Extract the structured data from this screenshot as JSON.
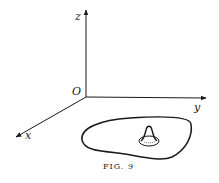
{
  "figure": {
    "caption": "Fig. 9",
    "caption_display": "FIG. 9",
    "axes": {
      "origin_label": "O",
      "z_label": "z",
      "y_label": "y",
      "x_label": "x"
    },
    "elements": [
      "three coordinate axes (x, y, z) from origin O",
      "closed curve region in the xy-plane",
      "small bump/peak surface inside the region"
    ],
    "colors": {
      "ink": "#1a1a1a",
      "background": "#ffffff"
    }
  }
}
